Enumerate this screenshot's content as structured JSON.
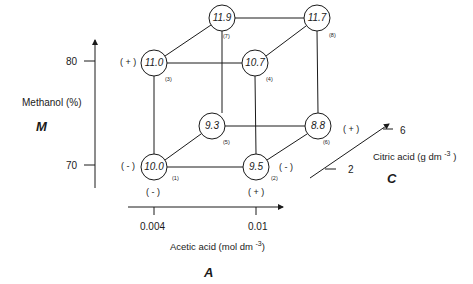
{
  "diagram": {
    "type": "factorial-design-cube",
    "axes": {
      "M": {
        "factor_letter": "M",
        "label": "Methanol (%)",
        "ticks": [
          {
            "value": "80",
            "level": "(+)"
          },
          {
            "value": "70",
            "level": "(-)"
          }
        ]
      },
      "A": {
        "factor_letter": "A",
        "label": "Acetic acid (mol dm -3)",
        "label_main": "Acetic acid (mol dm",
        "label_sup": "-3",
        "label_close": ")",
        "ticks": [
          {
            "value": "0.004",
            "level": "(-)"
          },
          {
            "value": "0.01",
            "level": "(+)"
          }
        ]
      },
      "C": {
        "factor_letter": "C",
        "label": "Citric acid (g dm -3 )",
        "label_main": "Citric acid (g dm",
        "label_sup": "-3",
        "label_close": ")",
        "ticks": [
          {
            "value": "6",
            "level": "(+)"
          },
          {
            "value": "2",
            "level": "(-)"
          }
        ]
      }
    },
    "level_signs": {
      "M_high": "( + )",
      "M_low": "( - )",
      "A_low": "( - )",
      "A_high": "( + )",
      "C_high": "( + )",
      "C_low": "( - )"
    },
    "nodes": [
      {
        "index": "(1)",
        "value": "10.0",
        "A": "-",
        "M": "-",
        "C": "-"
      },
      {
        "index": "(2)",
        "value": "9.5",
        "A": "+",
        "M": "-",
        "C": "-"
      },
      {
        "index": "(3)",
        "value": "11.0",
        "A": "-",
        "M": "+",
        "C": "-"
      },
      {
        "index": "(4)",
        "value": "10.7",
        "A": "+",
        "M": "+",
        "C": "-"
      },
      {
        "index": "(5)",
        "value": "9.3",
        "A": "-",
        "M": "-",
        "C": "+"
      },
      {
        "index": "(6)",
        "value": "8.8",
        "A": "+",
        "M": "-",
        "C": "+"
      },
      {
        "index": "(7)",
        "value": "11.9",
        "A": "-",
        "M": "+",
        "C": "+"
      },
      {
        "index": "(8)",
        "value": "11.7",
        "A": "+",
        "M": "+",
        "C": "+"
      }
    ]
  }
}
